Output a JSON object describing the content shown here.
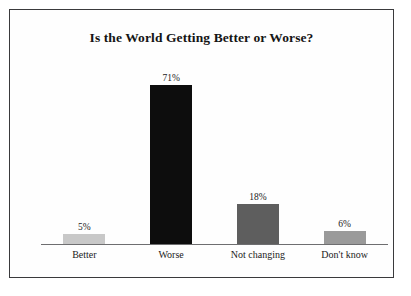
{
  "figure": {
    "background_color": "#ffffff",
    "frame_color": "#3a3a3c",
    "axis_color": "#6e6e70"
  },
  "chart_data": {
    "type": "bar",
    "title": "Is the World Getting Better or Worse?",
    "xlabel": "",
    "ylabel": "",
    "ylim": [
      0,
      80
    ],
    "grid": false,
    "legend": "none",
    "categories": [
      "Better",
      "Worse",
      "Not changing",
      "Don't know"
    ],
    "values": [
      5,
      71,
      18,
      6
    ],
    "value_labels": [
      "5%",
      "71%",
      "18%",
      "6%"
    ],
    "bar_colors": [
      "#c8c8c8",
      "#0d0d0d",
      "#5e5e5e",
      "#9a9a9a"
    ],
    "series": [
      {
        "name": "Share of respondents",
        "values": [
          5,
          71,
          18,
          6
        ]
      }
    ]
  }
}
